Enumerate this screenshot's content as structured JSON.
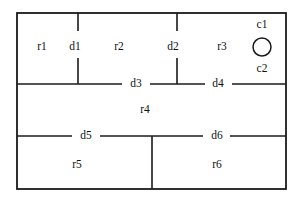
{
  "figure": {
    "background_color": "#ffffff",
    "line_color": "#1a1a1a",
    "text_color": "#111111"
  },
  "rooms": [
    {
      "id": "r1",
      "label": "r1",
      "x": 42,
      "y": 47
    },
    {
      "id": "r2",
      "label": "r2",
      "x": 119,
      "y": 47
    },
    {
      "id": "r3",
      "label": "r3",
      "x": 222,
      "y": 47
    },
    {
      "id": "r4",
      "label": "r4",
      "x": 145,
      "y": 110
    },
    {
      "id": "r5",
      "label": "r5",
      "x": 77,
      "y": 165
    },
    {
      "id": "r6",
      "label": "r6",
      "x": 217,
      "y": 165
    }
  ],
  "doors": [
    {
      "id": "d1",
      "label": "d1",
      "x": 75,
      "y": 47,
      "orientation": "vertical"
    },
    {
      "id": "d2",
      "label": "d2",
      "x": 173,
      "y": 47,
      "orientation": "vertical"
    },
    {
      "id": "d3",
      "label": "d3",
      "x": 136,
      "y": 84,
      "orientation": "horizontal"
    },
    {
      "id": "d4",
      "label": "d4",
      "x": 218,
      "y": 84,
      "orientation": "horizontal"
    },
    {
      "id": "d5",
      "label": "d5",
      "x": 86,
      "y": 136,
      "orientation": "horizontal"
    },
    {
      "id": "d6",
      "label": "d6",
      "x": 217,
      "y": 136,
      "orientation": "horizontal"
    }
  ],
  "features": [
    {
      "id": "c1",
      "label": "c1",
      "x": 262,
      "y": 25,
      "shape": "circle-label-top"
    },
    {
      "id": "c2",
      "label": "c2",
      "x": 262,
      "y": 69,
      "shape": "circle-label-bottom"
    }
  ],
  "circle": {
    "name": "circle-feature",
    "cx": 262,
    "cy": 47,
    "r": 9
  },
  "outer_boundary": {
    "x": 17,
    "y": 13,
    "width": 269,
    "height": 176
  },
  "wall_segments": {
    "top_vertical_d1_upper": {
      "x": 78,
      "y1": 13,
      "y2": 31
    },
    "top_vertical_d1_lower": {
      "x": 78,
      "y1": 58,
      "y2": 84
    },
    "top_vertical_d2_upper": {
      "x": 177,
      "y1": 13,
      "y2": 31
    },
    "top_vertical_d2_lower": {
      "x": 177,
      "y1": 58,
      "y2": 84
    },
    "mid_wall_left": {
      "y": 84,
      "x1": 17,
      "x2": 122
    },
    "mid_wall_center": {
      "y": 84,
      "x1": 150,
      "x2": 205
    },
    "mid_wall_right": {
      "y": 84,
      "x1": 232,
      "x2": 286
    },
    "lower_wall_left": {
      "y": 136,
      "x1": 17,
      "x2": 72
    },
    "lower_wall_center": {
      "y": 136,
      "x1": 100,
      "x2": 203
    },
    "lower_wall_right": {
      "y": 136,
      "x1": 230,
      "x2": 286
    },
    "bottom_vertical": {
      "x": 152,
      "y1": 136,
      "y2": 189
    }
  }
}
